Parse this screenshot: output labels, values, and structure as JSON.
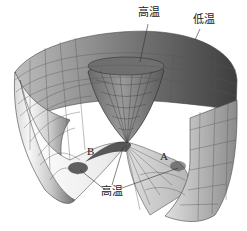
{
  "figure": {
    "labels": {
      "top_high_temp": "高温",
      "top_low_temp": "低温",
      "bottom_high_temp": "高温",
      "point_a": "A",
      "point_b": "B"
    },
    "colors": {
      "surface_light": "#f2f2f2",
      "surface_mid": "#bdbdbd",
      "surface_dark": "#4a4a4a",
      "grid_line": "#555555",
      "background": "#ffffff"
    }
  }
}
